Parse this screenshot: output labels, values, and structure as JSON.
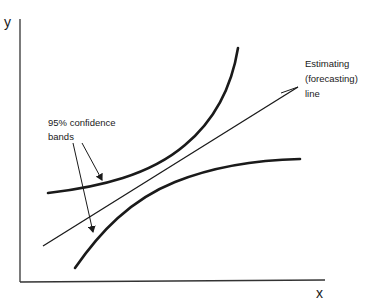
{
  "diagram": {
    "axes": {
      "y_label": "y",
      "x_label": "x"
    },
    "annotations": {
      "estimating_line": [
        "Estimating",
        "(forecasting)",
        "line"
      ],
      "confidence_bands": [
        "95% confidence",
        "bands"
      ]
    },
    "elements": [
      {
        "id": "estimating-line",
        "type": "straight line",
        "description": "regression / forecasting line rising left to right"
      },
      {
        "id": "upper-confidence-band",
        "type": "curve",
        "description": "upper 95% confidence band, curving upward away from line"
      },
      {
        "id": "lower-confidence-band",
        "type": "curve",
        "description": "lower 95% confidence band, curving away below line"
      }
    ],
    "colors": {
      "ink": "#1a1a1a",
      "background": "#ffffff"
    }
  }
}
